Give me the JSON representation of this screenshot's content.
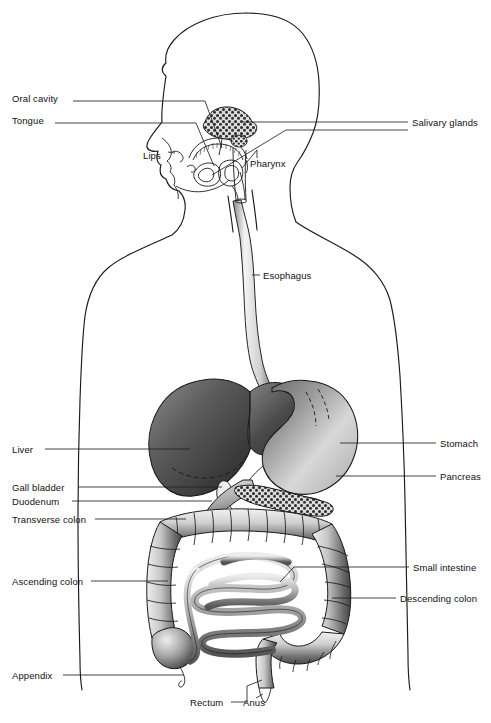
{
  "figure": {
    "background_color": "#ffffff",
    "line_color": "#1a1a1a",
    "text_color": "#111111",
    "width": 491,
    "height": 723
  },
  "labels": {
    "oral_cavity": "Oral cavity",
    "tongue": "Tongue",
    "lips": "Lips",
    "pharynx": "Pharynx",
    "salivary_glands": "Salivary glands",
    "esophagus": "Esophagus",
    "liver": "Liver",
    "gall_bladder": "Gall bladder",
    "duodenum": "Duodenum",
    "transverse_colon": "Transverse colon",
    "ascending_colon": "Ascending colon",
    "appendix": "Appendix",
    "stomach": "Stomach",
    "pancreas": "Pancreas",
    "small_intestine": "Small intestine",
    "descending_colon": "Descending colon",
    "rectum": "Rectum",
    "anus": "Anus"
  },
  "label_positions": {
    "oral_cavity": {
      "x": 12,
      "y": 98,
      "side": "left"
    },
    "tongue": {
      "x": 12,
      "y": 120,
      "side": "left"
    },
    "lips": {
      "x": 143,
      "y": 155,
      "side": "inline"
    },
    "pharynx": {
      "x": 250,
      "y": 163,
      "side": "inline"
    },
    "salivary_glands": {
      "x": 412,
      "y": 119,
      "side": "right"
    },
    "esophagus": {
      "x": 263,
      "y": 272,
      "side": "inline"
    },
    "liver": {
      "x": 12,
      "y": 446,
      "side": "left"
    },
    "gall_bladder": {
      "x": 12,
      "y": 484,
      "side": "left"
    },
    "duodenum": {
      "x": 12,
      "y": 498,
      "side": "left"
    },
    "transverse_colon": {
      "x": 12,
      "y": 516,
      "side": "left"
    },
    "ascending_colon": {
      "x": 12,
      "y": 578,
      "side": "left"
    },
    "appendix": {
      "x": 12,
      "y": 672,
      "side": "left"
    },
    "stomach": {
      "x": 440,
      "y": 440,
      "side": "right"
    },
    "pancreas": {
      "x": 440,
      "y": 473,
      "side": "right"
    },
    "small_intestine": {
      "x": 413,
      "y": 564,
      "side": "right"
    },
    "descending_colon": {
      "x": 400,
      "y": 595,
      "side": "right"
    },
    "rectum": {
      "x": 190,
      "y": 699,
      "side": "bottom"
    },
    "anus": {
      "x": 243,
      "y": 699,
      "side": "bottom"
    }
  },
  "organs": [
    {
      "name": "salivary-glands",
      "shading": "stippled",
      "tone": "dark"
    },
    {
      "name": "tongue",
      "shading": "outline",
      "tone": "light"
    },
    {
      "name": "esophagus",
      "shading": "tube",
      "tone": "light"
    },
    {
      "name": "liver",
      "shading": "gradient",
      "tone": "dark"
    },
    {
      "name": "stomach",
      "shading": "gradient",
      "tone": "mid"
    },
    {
      "name": "gall-bladder",
      "shading": "outline",
      "tone": "light"
    },
    {
      "name": "pancreas",
      "shading": "stippled",
      "tone": "dark"
    },
    {
      "name": "duodenum",
      "shading": "gradient",
      "tone": "mid"
    },
    {
      "name": "transverse-colon",
      "shading": "haustra",
      "tone": "mid"
    },
    {
      "name": "ascending-colon",
      "shading": "haustra",
      "tone": "mid"
    },
    {
      "name": "descending-colon",
      "shading": "haustra",
      "tone": "mid"
    },
    {
      "name": "small-intestine",
      "shading": "coiled",
      "tone": "mid"
    },
    {
      "name": "appendix",
      "shading": "outline",
      "tone": "light"
    },
    {
      "name": "rectum",
      "shading": "haustra",
      "tone": "mid"
    },
    {
      "name": "anus",
      "shading": "tube",
      "tone": "mid"
    }
  ]
}
